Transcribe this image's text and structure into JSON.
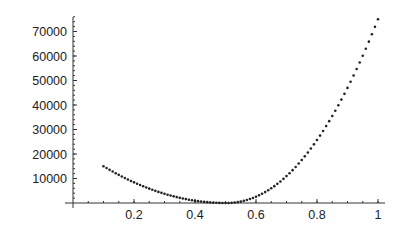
{
  "chart_data": {
    "type": "scatter",
    "title": "",
    "xlabel": "",
    "ylabel": "",
    "xlim": [
      0,
      1
    ],
    "ylim": [
      0,
      75000
    ],
    "grid": false,
    "legend": null,
    "x_ticks": [
      0.2,
      0.4,
      0.6,
      0.8,
      1
    ],
    "x_tick_labels": [
      "0.2",
      "0.4",
      "0.6",
      "0.8",
      "1"
    ],
    "y_ticks": [
      10000,
      20000,
      30000,
      40000,
      50000,
      60000,
      70000
    ],
    "y_tick_labels": [
      "10000",
      "20000",
      "30000",
      "40000",
      "50000",
      "60000",
      "70000"
    ],
    "x_minor_step": 0.05,
    "y_minor_step": 2000,
    "marker_color": "#222222",
    "series": [
      {
        "name": "data",
        "x": [
          0.1,
          0.11,
          0.12,
          0.13,
          0.14,
          0.15,
          0.16,
          0.17,
          0.18,
          0.19,
          0.2,
          0.21,
          0.22,
          0.23,
          0.24,
          0.25,
          0.26,
          0.27,
          0.28,
          0.29,
          0.3,
          0.31,
          0.32,
          0.33,
          0.34,
          0.35,
          0.36,
          0.37,
          0.38,
          0.39,
          0.4,
          0.41,
          0.42,
          0.43,
          0.44,
          0.45,
          0.46,
          0.47,
          0.48,
          0.49,
          0.5,
          0.51,
          0.52,
          0.53,
          0.54,
          0.55,
          0.56,
          0.57,
          0.58,
          0.59,
          0.6,
          0.61,
          0.62,
          0.63,
          0.64,
          0.65,
          0.66,
          0.67,
          0.68,
          0.69,
          0.7,
          0.71,
          0.72,
          0.73,
          0.74,
          0.75,
          0.76,
          0.77,
          0.78,
          0.79,
          0.8,
          0.81,
          0.82,
          0.83,
          0.84,
          0.85,
          0.86,
          0.87,
          0.88,
          0.89,
          0.9,
          0.91,
          0.92,
          0.93,
          0.94,
          0.95,
          0.96,
          0.97,
          0.98,
          0.99,
          1.0
        ],
        "y": [
          15000,
          14259,
          13538,
          12834,
          12150,
          11484,
          10838,
          10209,
          9600,
          9009,
          8438,
          7884,
          7350,
          6834,
          6338,
          5859,
          5400,
          4959,
          4538,
          4134,
          3750,
          3384,
          3038,
          2709,
          2400,
          2109,
          1838,
          1584,
          1350,
          1134,
          938,
          759,
          600,
          459,
          338,
          234,
          150,
          84,
          38,
          9,
          0,
          21,
          88,
          205,
          375,
          600,
          880,
          1215,
          1607,
          2057,
          2566,
          3133,
          3760,
          4447,
          5194,
          6004,
          6878,
          7810,
          8797,
          9861,
          10973,
          12148,
          13400,
          14724,
          16096,
          17528,
          19040,
          20604,
          22232,
          23932,
          25694,
          27510,
          29415,
          31389,
          33405,
          35498,
          37658,
          39908,
          42203,
          44543,
          46973,
          49478,
          52013,
          54675,
          57368,
          60128,
          62963,
          65858,
          68850,
          71888,
          75000
        ]
      }
    ]
  },
  "layout": {
    "origin_px": [
      73,
      203
    ],
    "x_scale_px_per_unit": 305,
    "y_scale_px_per_unit": 0.00245
  }
}
